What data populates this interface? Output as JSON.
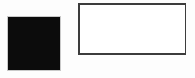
{
  "canvas": {
    "background_color": "#fdfdfd",
    "width_px": 195,
    "height_px": 78
  },
  "shapes": {
    "filled_square": {
      "name": "filled black square",
      "fill_color": "#0c0c0c",
      "border_color": "#0c0c0c"
    },
    "outlined_rectangle": {
      "name": "white rectangle with dark outline",
      "fill_color": "#ffffff",
      "border_color": "#3c3c3c"
    }
  }
}
